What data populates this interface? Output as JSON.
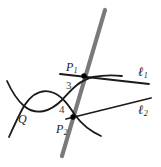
{
  "figure": {
    "width": 161,
    "height": 167,
    "background_color": "#ffffff"
  },
  "colors": {
    "curve": "#1a1a1a",
    "line": "#1a1a1a",
    "secant": "#7a7a7a",
    "point": "#000000",
    "label": "#1a1a1a",
    "numeral": "#3c3c3c"
  },
  "labels": {
    "point_P1": "P",
    "point_P1_sub": "1",
    "point_P2": "P",
    "point_P2_sub": "2",
    "node_Q": "Q",
    "line_l1": "ℓ",
    "line_l1_sub": "1",
    "line_l2": "ℓ",
    "line_l2_sub": "2",
    "multiplicity_3": "3",
    "multiplicity_4": "4"
  },
  "geometry": {
    "secant_line": {
      "name": "gray-secant",
      "x1": 105,
      "y1": 10,
      "x2": 62,
      "y2": 156,
      "stroke_width": 4,
      "color": "#7a7a7a"
    },
    "line_l1": {
      "name": "line-ell-1",
      "x1": 80,
      "y1": 76,
      "x2": 148,
      "y2": 84,
      "stroke_width": 1.8
    },
    "line_l2": {
      "name": "line-ell-2",
      "x1": 73,
      "y1": 117,
      "x2": 150,
      "y2": 99,
      "stroke_width": 1.8
    },
    "points": [
      {
        "name": "P1",
        "x": 84,
        "y": 76
      },
      {
        "name": "P2",
        "x": 73,
        "y": 117
      }
    ],
    "node": {
      "name": "Q",
      "x": 23,
      "y": 107
    },
    "curve_upper_branch": "M 8,84 C 14,96 20,103 27,107 C 42,114 56,105 66,93 C 74,84 80,79 92,77 C 104,75 112,75 120,76",
    "curve_lower_branch": "M 10,134 C 14,126 18,116 23,107 C 30,96 40,90 52,94 C 62,98 68,106 74,114 C 82,124 92,130 100,134"
  }
}
